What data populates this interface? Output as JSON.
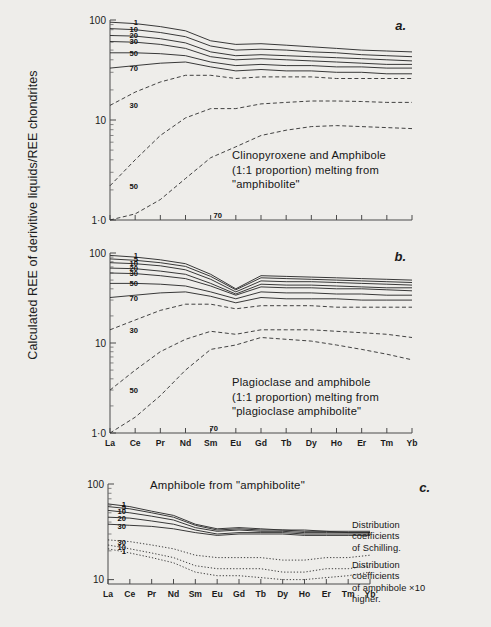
{
  "axis_label": "Calculated REE of derivitive liquids/REE chondrites",
  "elements": [
    "La",
    "Ce",
    "Pr",
    "Nd",
    "Sm",
    "Eu",
    "Gd",
    "Tb",
    "Dy",
    "Ho",
    "Er",
    "Tm",
    "Yb"
  ],
  "y_ticks": [
    "100",
    "10",
    "1·0"
  ],
  "y_ticks_c": [
    "100",
    "10"
  ],
  "panels": {
    "a": {
      "letter": "a.",
      "caption": "Clinopyroxene and Amphibole\n(1:1 proportion) melting from\n\"amphibolite\"",
      "solid_labels": [
        "1",
        "10",
        "20",
        "30",
        "50",
        "70"
      ],
      "dashed_labels": [
        "30",
        "50",
        "70"
      ]
    },
    "b": {
      "letter": "b.",
      "caption": "Plagioclase and amphibole\n(1:1 proportion) melting from\n\"plagioclase amphibolite\"",
      "solid_labels": [
        "1",
        "5",
        "10",
        "20",
        "30",
        "50",
        "70"
      ],
      "dashed_labels": [
        "30",
        "50",
        "70"
      ]
    },
    "c": {
      "letter": "c.",
      "title": "Amphibole from \"amphibolite\"",
      "solid_labels": [
        "1",
        "5",
        "10",
        "20",
        "30"
      ],
      "dotted_labels": [
        "30",
        "10",
        "1"
      ],
      "note_schilling": "Distribution coefficients\nof Schilling.",
      "note_amphibole": "Distribution coefficients\nof amphibole ×10 higher."
    }
  },
  "chart_data": {
    "type": "line",
    "xlabel": "",
    "ylabel": "Calculated REE of derivitive liquids/REE chondrites",
    "x": [
      "La",
      "Ce",
      "Pr",
      "Nd",
      "Sm",
      "Eu",
      "Gd",
      "Tb",
      "Dy",
      "Ho",
      "Er",
      "Tm",
      "Yb"
    ],
    "ylim": [
      1.0,
      100
    ],
    "yscale": "log",
    "grid": false,
    "legend": "inline-curve-labels",
    "panels": [
      {
        "id": "a",
        "label": "a.",
        "caption": "Clinopyroxene and Amphibole (1:1 proportion) melting from \"amphibolite\"",
        "series": [
          {
            "name": "1",
            "style": "solid",
            "values": [
              95,
              92,
              86,
              78,
              62,
              57,
              58,
              56,
              54,
              52,
              50,
              49,
              48
            ]
          },
          {
            "name": "10",
            "style": "solid",
            "values": [
              82,
              80,
              75,
              68,
              55,
              50,
              51,
              50,
              48,
              47,
              45,
              44,
              43
            ]
          },
          {
            "name": "20",
            "style": "solid",
            "values": [
              70,
              69,
              65,
              59,
              48,
              44,
              45,
              44,
              43,
              42,
              41,
              40,
              39
            ]
          },
          {
            "name": "30",
            "style": "solid",
            "values": [
              61,
              60,
              57,
              52,
              43,
              40,
              41,
              40,
              39,
              38,
              37,
              36,
              36
            ]
          },
          {
            "name": "50",
            "style": "solid",
            "values": [
              47,
              47,
              46,
              44,
              38,
              35,
              36,
              35,
              35,
              34,
              34,
              33,
              33
            ]
          },
          {
            "name": "70",
            "style": "solid",
            "values": [
              33,
              35,
              37,
              38,
              34,
              31,
              32,
              31,
              31,
              30,
              30,
              29,
              29
            ]
          },
          {
            "name": "30",
            "style": "dashed",
            "values": [
              14,
              19,
              24,
              28,
              28,
              26,
              27,
              27,
              27,
              26,
              26,
              26,
              26
            ]
          },
          {
            "name": "50",
            "style": "dashed",
            "values": [
              2.2,
              4.0,
              7.0,
              10.5,
              13.0,
              13.0,
              14.5,
              15.0,
              15.5,
              15.5,
              15.3,
              15.0,
              15.0
            ]
          },
          {
            "name": "70",
            "style": "dashed",
            "values": [
              1.0,
              1.15,
              1.6,
              2.6,
              4.2,
              5.4,
              7.0,
              7.9,
              8.6,
              8.8,
              8.6,
              8.4,
              8.2
            ]
          }
        ]
      },
      {
        "id": "b",
        "label": "b.",
        "caption": "Plagioclase and amphibole (1:1 proportion) melting from \"plagioclase amphibolite\"",
        "series": [
          {
            "name": "1",
            "style": "solid",
            "values": [
              94,
              90,
              84,
              76,
              58,
              40,
              56,
              55,
              54,
              53,
              52,
              51,
              50
            ]
          },
          {
            "name": "5",
            "style": "solid",
            "values": [
              86,
              83,
              78,
              71,
              55,
              39,
              53,
              52,
              51,
              50,
              49,
              48,
              47
            ]
          },
          {
            "name": "10",
            "style": "solid",
            "values": [
              78,
              76,
              72,
              65,
              51,
              37,
              49,
              48,
              48,
              47,
              46,
              45,
              44
            ]
          },
          {
            "name": "20",
            "style": "solid",
            "values": [
              68,
              67,
              63,
              58,
              46,
              35,
              45,
              44,
              44,
              43,
              42,
              41,
              41
            ]
          },
          {
            "name": "30",
            "style": "solid",
            "values": [
              60,
              59,
              56,
              52,
              43,
              34,
              42,
              41,
              41,
              40,
              40,
              39,
              38
            ]
          },
          {
            "name": "50",
            "style": "solid",
            "values": [
              46,
              46,
              45,
              43,
              37,
              31,
              37,
              36,
              36,
              35,
              35,
              34,
              34
            ]
          },
          {
            "name": "70",
            "style": "solid",
            "values": [
              32,
              34,
              36,
              37,
              33,
              28,
              32,
              31,
              31,
              31,
              30,
              30,
              30
            ]
          },
          {
            "name": "30",
            "style": "dashed",
            "values": [
              14,
              18,
              23,
              27,
              27,
              24,
              26,
              26,
              26,
              25,
              25,
              25,
              25
            ]
          },
          {
            "name": "50",
            "style": "dashed",
            "values": [
              3.0,
              5.0,
              8.0,
              11.0,
              13.5,
              12.5,
              14.0,
              14.0,
              14.0,
              13.5,
              13.0,
              12.5,
              11.5
            ]
          },
          {
            "name": "70",
            "style": "dashed",
            "values": [
              1.0,
              1.5,
              2.6,
              5.0,
              8.5,
              9.5,
              11.5,
              11.0,
              10.5,
              9.5,
              8.5,
              7.5,
              6.5
            ]
          }
        ]
      },
      {
        "id": "c",
        "label": "c.",
        "caption": "Amphibole from \"amphibolite\"",
        "series": [
          {
            "name": "1",
            "style": "solid",
            "values": [
              62,
              58,
              52,
              47,
              38,
              34,
              35,
              34,
              33,
              33,
              32,
              32,
              32
            ]
          },
          {
            "name": "5",
            "style": "solid",
            "values": [
              58,
              55,
              50,
              45,
              37,
              33,
              34,
              33,
              33,
              32,
              32,
              31,
              31
            ]
          },
          {
            "name": "10",
            "style": "solid",
            "values": [
              53,
              50,
              46,
              42,
              35,
              32,
              33,
              32,
              32,
              31,
              31,
              31,
              31
            ]
          },
          {
            "name": "20",
            "style": "solid",
            "values": [
              45,
              44,
              41,
              38,
              33,
              30,
              31,
              31,
              31,
              30,
              30,
              30,
              30
            ]
          },
          {
            "name": "30",
            "style": "solid",
            "values": [
              38,
              37,
              36,
              34,
              31,
              29,
              30,
              30,
              30,
              29,
              29,
              29,
              29
            ]
          },
          {
            "name": "30",
            "style": "dotted",
            "values": [
              26,
              25,
              23,
              21,
              18,
              17,
              17,
              17,
              16,
              16,
              17,
              17,
              18
            ]
          },
          {
            "name": "10",
            "style": "dotted",
            "values": [
              23,
              21,
              19,
              17,
              14,
              13,
              13,
              13,
              12,
              12,
              13,
              13,
              14
            ]
          },
          {
            "name": "1",
            "style": "dotted",
            "values": [
              21,
              19,
              17,
              15,
              12,
              11,
              11,
              10.5,
              10,
              10,
              10.5,
              11,
              12
            ]
          }
        ],
        "annotations": [
          "Distribution coefficients of Schilling.",
          "Distribution coefficients of amphibole ×10 higher."
        ]
      }
    ]
  }
}
